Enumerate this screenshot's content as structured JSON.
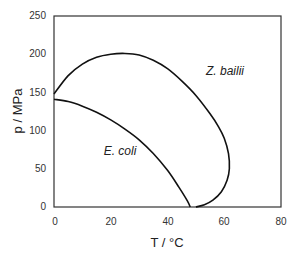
{
  "chart_data": {
    "type": "line",
    "title": "",
    "xlabel": "T / °C",
    "ylabel": "p / MPa",
    "xlim": [
      0,
      80
    ],
    "ylim": [
      0,
      250
    ],
    "x_ticks": [
      "0",
      "20",
      "40",
      "60",
      "80"
    ],
    "y_ticks": [
      "0",
      "50",
      "100",
      "150",
      "200",
      "250"
    ],
    "grid": false,
    "legend": "none (inline annotations)",
    "series": [
      {
        "name": "Z. bailii",
        "points": [
          [
            0,
            148
          ],
          [
            5,
            172
          ],
          [
            10,
            187
          ],
          [
            15,
            196
          ],
          [
            20,
            200
          ],
          [
            25,
            201
          ],
          [
            30,
            199
          ],
          [
            35,
            192
          ],
          [
            40,
            181
          ],
          [
            45,
            165
          ],
          [
            50,
            146
          ],
          [
            55,
            122
          ],
          [
            58,
            105
          ],
          [
            60,
            90
          ],
          [
            61.5,
            70
          ],
          [
            61.8,
            50
          ],
          [
            61,
            35
          ],
          [
            59,
            20
          ],
          [
            56,
            9
          ],
          [
            53,
            3
          ],
          [
            50,
            0
          ]
        ]
      },
      {
        "name": "E. coli",
        "points": [
          [
            0,
            141
          ],
          [
            5,
            138
          ],
          [
            10,
            132
          ],
          [
            15,
            124
          ],
          [
            20,
            114
          ],
          [
            25,
            102
          ],
          [
            30,
            88
          ],
          [
            35,
            70
          ],
          [
            40,
            48
          ],
          [
            44,
            26
          ],
          [
            47,
            8
          ],
          [
            48,
            0
          ]
        ]
      }
    ],
    "annotations": [
      {
        "text": "Z. bailii",
        "x": 62,
        "y": 178
      },
      {
        "text": "E. coli",
        "x": 22,
        "y": 100
      }
    ]
  },
  "labels": {
    "xlabel": "T / °C",
    "ylabel": "p / MPa",
    "annot_zb": "Z. bailii",
    "annot_ec": "E. coli",
    "x_ticks": [
      "0",
      "20",
      "40",
      "60",
      "80"
    ],
    "y_ticks": [
      "0",
      "50",
      "100",
      "150",
      "200",
      "250"
    ]
  }
}
